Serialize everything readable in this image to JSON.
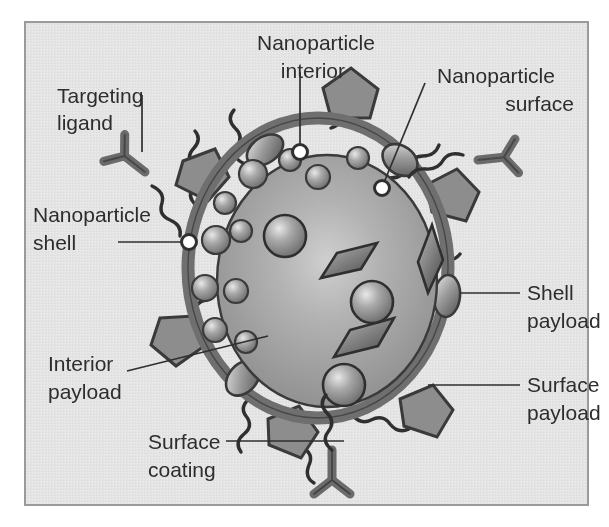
{
  "figure": {
    "background_color": "#ffffff",
    "panel_color": "#e3e3e3",
    "panel_border_color": "#9a9a9a",
    "text_color": "#2d2d2d",
    "shell_ring_color": "#6f6f6f",
    "core_color": "#9d9d9d",
    "payload_color": "#8a8a8a",
    "outline_color": "#3a3a3a"
  },
  "labels": {
    "targeting_ligand": {
      "line1": "Targeting",
      "line2": "ligand"
    },
    "nanoparticle_shell": {
      "line1": "Nanoparticle",
      "line2": "shell"
    },
    "interior_payload": {
      "line1": "Interior",
      "line2": "payload"
    },
    "surface_coating": {
      "line1": "Surface",
      "line2": "coating"
    },
    "nanoparticle_interior": {
      "line1": "Nanoparticle",
      "line2": "interior"
    },
    "nanoparticle_surface": {
      "line1": "Nanoparticle",
      "line2": "surface"
    },
    "shell_payload": {
      "line1": "Shell",
      "line2": "payload"
    },
    "surface_payload": {
      "line1": "Surface",
      "line2": "payload"
    }
  },
  "diagram_parts": [
    {
      "name": "nanoparticle-core",
      "description": "inner sphere (nanoparticle interior)"
    },
    {
      "name": "nanoparticle-shell",
      "description": "dark ring surrounding core"
    },
    {
      "name": "nanoparticle-surface",
      "description": "outer boundary of core sphere"
    },
    {
      "name": "interior-payload",
      "description": "rhombus and sphere inclusions inside core"
    },
    {
      "name": "shell-payload",
      "description": "ellipsoids embedded in shell ring"
    },
    {
      "name": "surface-payload",
      "description": "pentagon shapes on outer surface"
    },
    {
      "name": "surface-coating",
      "description": "wavy polymer chains on the surface"
    },
    {
      "name": "targeting-ligand",
      "description": "Y-shaped antibody on chain ends"
    }
  ]
}
